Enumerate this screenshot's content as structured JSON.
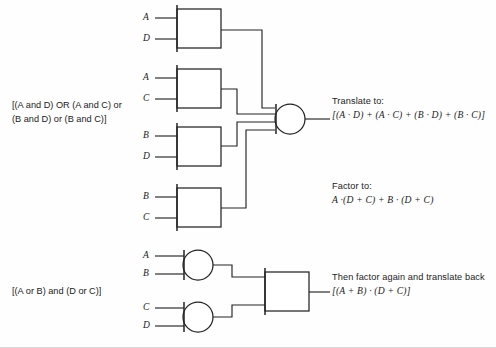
{
  "figure": {
    "type": "logic-gate-diagram",
    "background_color": "#fefefe",
    "line_color": "#232323"
  },
  "labels": {
    "boolean_sum_of_products": "[(A and D) OR (A and C) or (B and D) or (B and C)]",
    "boolean_sum_of_products_line1": "[(A and D) OR (A and C) or",
    "boolean_sum_of_products_line2": "(B and D) or (B and C)]",
    "boolean_product_of_sums": "[(A or B) and (D or C)]"
  },
  "annotations": {
    "translate": {
      "header": "Translate to:",
      "formula": "[(A · D) + (A · C) + (B · D) + (B · C)]"
    },
    "factor": {
      "header": "Factor to:",
      "formula": "A ·(D + C) + B · (D + C)"
    },
    "refactor": {
      "header": "Then factor again and translate back",
      "formula": "[(A + B) · (D + C)]"
    }
  },
  "gates": [
    {
      "id": "and-1",
      "kind": "AND",
      "shape": "box",
      "inputs": [
        "A",
        "D"
      ],
      "output_to": "or-1"
    },
    {
      "id": "and-2",
      "kind": "AND",
      "shape": "box",
      "inputs": [
        "A",
        "C"
      ],
      "output_to": "or-1"
    },
    {
      "id": "and-3",
      "kind": "AND",
      "shape": "box",
      "inputs": [
        "B",
        "D"
      ],
      "output_to": "or-1"
    },
    {
      "id": "and-4",
      "kind": "AND",
      "shape": "box",
      "inputs": [
        "B",
        "C"
      ],
      "output_to": "or-1"
    },
    {
      "id": "or-1",
      "kind": "OR",
      "shape": "circle",
      "inputs": [
        "and-1",
        "and-2",
        "and-3",
        "and-4"
      ],
      "output_to": "translate"
    },
    {
      "id": "or-2",
      "kind": "OR",
      "shape": "circle",
      "inputs": [
        "A",
        "B"
      ],
      "output_to": "and-5"
    },
    {
      "id": "or-3",
      "kind": "OR",
      "shape": "circle",
      "inputs": [
        "C",
        "D"
      ],
      "output_to": "and-5"
    },
    {
      "id": "and-5",
      "kind": "AND",
      "shape": "box",
      "inputs": [
        "or-2",
        "or-3"
      ],
      "output_to": "refactor"
    }
  ],
  "pins": {
    "and1_in1": "A",
    "and1_in2": "D",
    "and2_in1": "A",
    "and2_in2": "C",
    "and3_in1": "B",
    "and3_in2": "D",
    "and4_in1": "B",
    "and4_in2": "C",
    "or2_in1": "A",
    "or2_in2": "B",
    "or3_in1": "C",
    "or3_in2": "D"
  }
}
